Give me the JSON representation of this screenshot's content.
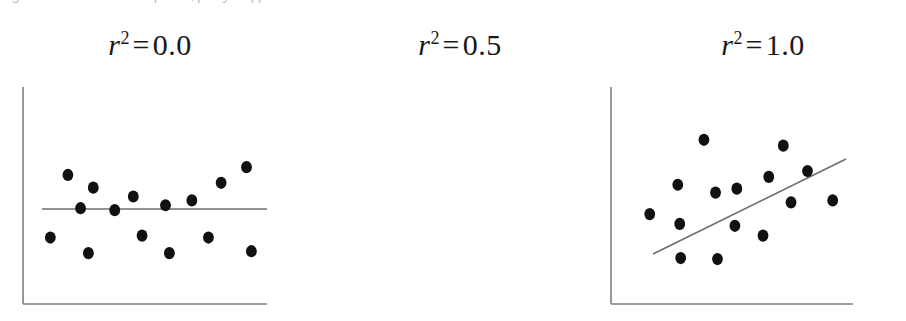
{
  "caption_sliver": {
    "text": "Figure — illustration of r-squared, partly cropped"
  },
  "figure": {
    "background_color": "#ffffff",
    "axis_color": "#7d7d7d",
    "point_color": "#111111",
    "line_color": "#6e6e6e",
    "title_color": "#191919"
  },
  "panels": [
    {
      "id": "panel-0",
      "title_var": "r",
      "title_sup": "2",
      "title_eq": "=",
      "title_value": "0.0",
      "title_full": "r² = 0.0"
    },
    {
      "id": "panel-1",
      "title_var": "r",
      "title_sup": "2",
      "title_eq": "=",
      "title_value": "0.5",
      "title_full": "r² = 0.5"
    },
    {
      "id": "panel-2",
      "title_var": "r",
      "title_sup": "2",
      "title_eq": "=",
      "title_value": "1.0",
      "title_full": "r² = 1.0"
    }
  ],
  "chart_data": [
    {
      "type": "scatter",
      "title": "r² = 0.0",
      "xlabel": "",
      "ylabel": "",
      "r_squared": 0.0,
      "xlim": [
        0,
        250
      ],
      "ylim": [
        0,
        222
      ],
      "grid": false,
      "legend": "none",
      "axes": {
        "spines": [
          "left",
          "bottom"
        ],
        "ticks": false,
        "ticklabels": false
      },
      "points": [
        {
          "x": 72,
          "y": 119
        },
        {
          "x": 46,
          "y": 132
        },
        {
          "x": 113,
          "y": 110
        },
        {
          "x": 146,
          "y": 101
        },
        {
          "x": 173,
          "y": 106
        },
        {
          "x": 203,
          "y": 124
        },
        {
          "x": 59,
          "y": 98
        },
        {
          "x": 229,
          "y": 140
        },
        {
          "x": 28,
          "y": 68
        },
        {
          "x": 67,
          "y": 52
        },
        {
          "x": 122,
          "y": 70
        },
        {
          "x": 150,
          "y": 52
        },
        {
          "x": 190,
          "y": 68
        },
        {
          "x": 234,
          "y": 54
        },
        {
          "x": 94,
          "y": 96
        }
      ],
      "fit_line": {
        "x0": 19,
        "y0": 95,
        "x1": 244,
        "y1": 95,
        "slope": 0.0
      }
    },
    {
      "type": "scatter",
      "title": "r² = 0.5",
      "xlabel": "",
      "ylabel": "",
      "r_squared": 0.5,
      "xlim": [
        0,
        250
      ],
      "ylim": [
        0,
        222
      ],
      "grid": false,
      "legend": "none",
      "axes": {
        "spines": [
          "left",
          "bottom"
        ],
        "ticks": false,
        "ticklabels": false
      },
      "points": [
        {
          "x": 40,
          "y": 92
        },
        {
          "x": 69,
          "y": 122
        },
        {
          "x": 71,
          "y": 82
        },
        {
          "x": 72,
          "y": 47
        },
        {
          "x": 108,
          "y": 114
        },
        {
          "x": 110,
          "y": 46
        },
        {
          "x": 128,
          "y": 80
        },
        {
          "x": 130,
          "y": 118
        },
        {
          "x": 157,
          "y": 70
        },
        {
          "x": 163,
          "y": 130
        },
        {
          "x": 178,
          "y": 162
        },
        {
          "x": 186,
          "y": 104
        },
        {
          "x": 203,
          "y": 136
        },
        {
          "x": 229,
          "y": 106
        },
        {
          "x": 96,
          "y": 168
        }
      ],
      "fit_line": {
        "x0": 45,
        "y0": 50,
        "x1": 238,
        "y1": 145,
        "slope": 0.49
      }
    },
    {
      "type": "scatter",
      "title": "r² = 1.0",
      "xlabel": "",
      "ylabel": "",
      "r_squared": 1.0,
      "xlim": [
        0,
        250
      ],
      "ylim": [
        0,
        222
      ],
      "grid": false,
      "legend": "none",
      "axes": {
        "spines": [
          "left",
          "bottom"
        ],
        "ticks": false,
        "ticklabels": false
      },
      "points": [
        {
          "x": 51,
          "y": 57
        },
        {
          "x": 79,
          "y": 70
        },
        {
          "x": 107,
          "y": 83
        },
        {
          "x": 135,
          "y": 97
        },
        {
          "x": 163,
          "y": 111
        },
        {
          "x": 191,
          "y": 124
        },
        {
          "x": 219,
          "y": 138
        },
        {
          "x": 245,
          "y": 151
        }
      ],
      "fit_line": {
        "x0": 51,
        "y0": 57,
        "x1": 245,
        "y1": 151,
        "slope": 0.484
      }
    }
  ]
}
